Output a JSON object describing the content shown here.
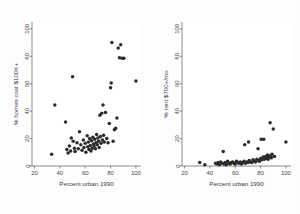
{
  "figure": {
    "background_color": "#fdfdfd",
    "point_color": "#2b2b2b",
    "axis_color": "#5a5a5a"
  },
  "chart_data": [
    {
      "type": "scatter",
      "panel": "left",
      "title": "",
      "xlabel": "Percent urban 1990",
      "ylabel": "% homes cost $100K+",
      "xlim": [
        18,
        104
      ],
      "ylim": [
        0,
        105
      ],
      "xticks": [
        20,
        40,
        60,
        80,
        100
      ],
      "yticks": [
        0,
        20,
        40,
        60,
        80,
        100
      ],
      "grid": false,
      "legend": "none",
      "points": [
        [
          33.5,
          8.5
        ],
        [
          36.0,
          44.5
        ],
        [
          44.5,
          32.0
        ],
        [
          45.5,
          12.0
        ],
        [
          46.5,
          9.5
        ],
        [
          47.5,
          14.5
        ],
        [
          48.5,
          11.0
        ],
        [
          49.0,
          20.5
        ],
        [
          50.0,
          65.0
        ],
        [
          50.5,
          18.0
        ],
        [
          51.5,
          13.0
        ],
        [
          52.0,
          10.5
        ],
        [
          53.5,
          17.0
        ],
        [
          54.5,
          12.5
        ],
        [
          55.5,
          25.0
        ],
        [
          56.5,
          15.5
        ],
        [
          57.5,
          11.5
        ],
        [
          58.5,
          19.0
        ],
        [
          59.0,
          13.5
        ],
        [
          60.0,
          16.5
        ],
        [
          60.5,
          10.0
        ],
        [
          61.5,
          22.0
        ],
        [
          62.0,
          14.0
        ],
        [
          62.5,
          17.5
        ],
        [
          63.0,
          12.0
        ],
        [
          63.5,
          20.0
        ],
        [
          64.0,
          15.0
        ],
        [
          64.5,
          11.0
        ],
        [
          65.0,
          18.5
        ],
        [
          65.5,
          13.0
        ],
        [
          66.0,
          21.0
        ],
        [
          66.5,
          16.0
        ],
        [
          67.0,
          14.5
        ],
        [
          67.5,
          19.5
        ],
        [
          68.0,
          12.5
        ],
        [
          68.5,
          17.0
        ],
        [
          69.0,
          23.0
        ],
        [
          69.5,
          15.5
        ],
        [
          70.0,
          20.5
        ],
        [
          70.5,
          18.0
        ],
        [
          71.0,
          13.5
        ],
        [
          71.5,
          37.0
        ],
        [
          72.0,
          21.5
        ],
        [
          72.5,
          16.5
        ],
        [
          73.0,
          38.5
        ],
        [
          73.5,
          19.0
        ],
        [
          74.0,
          44.5
        ],
        [
          74.5,
          22.5
        ],
        [
          75.0,
          17.5
        ],
        [
          76.0,
          39.0
        ],
        [
          77.0,
          20.0
        ],
        [
          78.0,
          17.0
        ],
        [
          79.0,
          31.0
        ],
        [
          80.0,
          57.0
        ],
        [
          80.5,
          60.5
        ],
        [
          81.0,
          90.0
        ],
        [
          82.0,
          18.0
        ],
        [
          83.0,
          26.5
        ],
        [
          84.0,
          27.5
        ],
        [
          85.0,
          35.0
        ],
        [
          86.0,
          86.0
        ],
        [
          87.0,
          79.0
        ],
        [
          88.0,
          88.5
        ],
        [
          89.0,
          78.5
        ],
        [
          90.5,
          78.5
        ],
        [
          100.0,
          62.0
        ]
      ]
    },
    {
      "type": "scatter",
      "panel": "right",
      "title": "",
      "xlabel": "Percent urban 1990",
      "ylabel": "% rent $700+/mo",
      "xlim": [
        18,
        104
      ],
      "ylim": [
        0,
        105
      ],
      "xticks": [
        20,
        40,
        60,
        80,
        100
      ],
      "yticks": [
        0,
        20,
        40,
        60,
        80,
        100
      ],
      "grid": false,
      "legend": "none",
      "points": [
        [
          32.0,
          2.5
        ],
        [
          36.0,
          1.0
        ],
        [
          44.5,
          2.0
        ],
        [
          45.5,
          1.5
        ],
        [
          46.5,
          2.5
        ],
        [
          47.5,
          1.0
        ],
        [
          48.5,
          3.0
        ],
        [
          49.5,
          2.0
        ],
        [
          50.5,
          10.5
        ],
        [
          51.0,
          1.5
        ],
        [
          52.0,
          2.5
        ],
        [
          53.0,
          1.0
        ],
        [
          54.0,
          3.5
        ],
        [
          55.0,
          2.0
        ],
        [
          56.0,
          1.5
        ],
        [
          57.0,
          2.5
        ],
        [
          58.0,
          3.0
        ],
        [
          59.0,
          2.0
        ],
        [
          60.0,
          1.5
        ],
        [
          61.0,
          3.5
        ],
        [
          62.0,
          2.5
        ],
        [
          63.0,
          2.0
        ],
        [
          64.0,
          3.0
        ],
        [
          65.0,
          1.5
        ],
        [
          66.0,
          2.5
        ],
        [
          67.0,
          3.5
        ],
        [
          67.5,
          15.5
        ],
        [
          68.0,
          2.0
        ],
        [
          69.0,
          3.0
        ],
        [
          70.0,
          2.5
        ],
        [
          70.5,
          17.5
        ],
        [
          71.0,
          4.0
        ],
        [
          72.0,
          3.0
        ],
        [
          73.0,
          2.5
        ],
        [
          74.0,
          4.5
        ],
        [
          75.0,
          3.5
        ],
        [
          76.0,
          3.0
        ],
        [
          77.0,
          5.0
        ],
        [
          78.0,
          12.5
        ],
        [
          78.5,
          4.0
        ],
        [
          79.0,
          3.5
        ],
        [
          80.0,
          5.5
        ],
        [
          80.5,
          19.5
        ],
        [
          81.0,
          4.5
        ],
        [
          82.0,
          6.5
        ],
        [
          82.5,
          19.5
        ],
        [
          83.0,
          5.0
        ],
        [
          84.0,
          7.0
        ],
        [
          84.5,
          5.5
        ],
        [
          85.0,
          6.0
        ],
        [
          85.5,
          8.0
        ],
        [
          86.0,
          5.0
        ],
        [
          86.5,
          7.5
        ],
        [
          87.0,
          6.5
        ],
        [
          87.5,
          31.5
        ],
        [
          88.0,
          7.0
        ],
        [
          88.5,
          6.0
        ],
        [
          89.0,
          8.5
        ],
        [
          90.0,
          27.0
        ],
        [
          91.0,
          7.0
        ],
        [
          100.0,
          17.5
        ]
      ]
    }
  ]
}
